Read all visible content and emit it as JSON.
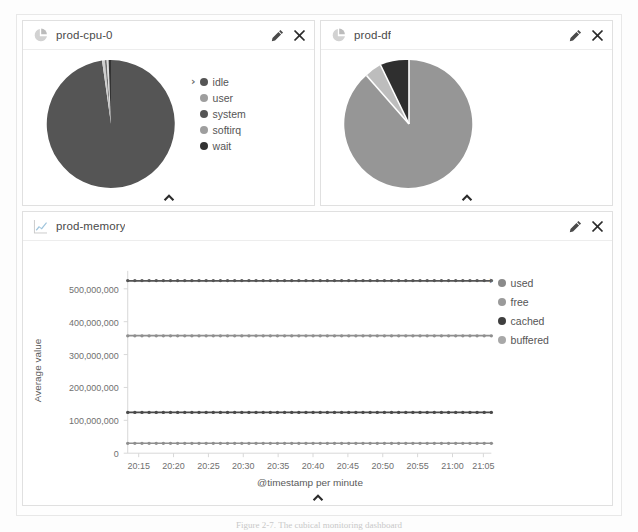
{
  "dashboard": {
    "panels": [
      {
        "id": "prod-cpu-0",
        "title": "prod-cpu-0",
        "icon": "pie-chart-icon",
        "type": "pie",
        "edit_label": "Edit",
        "close_label": "Close",
        "collapse_label": "Collapse panel",
        "legend_toggle": "›",
        "legend": [
          {
            "label": "idle",
            "color": "#555555"
          },
          {
            "label": "user",
            "color": "#9e9e9e"
          },
          {
            "label": "system",
            "color": "#555555"
          },
          {
            "label": "softirq",
            "color": "#9e9e9e"
          },
          {
            "label": "wait",
            "color": "#333333"
          }
        ]
      },
      {
        "id": "prod-df",
        "title": "prod-df",
        "icon": "pie-chart-icon",
        "type": "pie",
        "edit_label": "Edit",
        "close_label": "Close",
        "collapse_label": "Collapse panel",
        "legend_toggle": "›",
        "legend": [
          {
            "label": "free",
            "color": "#969696"
          },
          {
            "label": "used",
            "color": "#bdbdbd"
          },
          {
            "label": "reserved",
            "color": "#3b3b3b"
          }
        ]
      },
      {
        "id": "prod-memory",
        "title": "prod-memory",
        "icon": "line-chart-icon",
        "type": "line",
        "edit_label": "Edit",
        "close_label": "Close",
        "collapse_label": "Collapse panel",
        "legend_toggle": "›",
        "legend": [
          {
            "label": "used",
            "color": "#8a8a8a"
          },
          {
            "label": "free",
            "color": "#9a9a9a"
          },
          {
            "label": "cached",
            "color": "#3f3f3f"
          },
          {
            "label": "buffered",
            "color": "#a8a8a8"
          }
        ]
      }
    ]
  },
  "chart_data": [
    {
      "type": "pie",
      "title": "prod-cpu-0",
      "labels": [
        "idle",
        "user",
        "system",
        "softirq",
        "wait"
      ],
      "values": [
        97.2,
        1.1,
        0.9,
        0.5,
        0.3
      ],
      "colors": [
        "#555555",
        "#c9c9c9",
        "#6f6f6f",
        "#d8d8d8",
        "#333333"
      ],
      "legend": "right"
    },
    {
      "type": "pie",
      "title": "prod-df",
      "labels": [
        "free",
        "used",
        "reserved"
      ],
      "values": [
        82.0,
        10.5,
        7.5
      ],
      "colors": [
        "#969696",
        "#bdbdbd",
        "#2f2f2f"
      ],
      "legend": "right"
    },
    {
      "type": "line",
      "title": "prod-memory",
      "xlabel": "@timestamp per minute",
      "ylabel": "Average value",
      "ylim": [
        0,
        530000000
      ],
      "yticks": [
        0,
        100000000,
        200000000,
        300000000,
        400000000,
        500000000
      ],
      "ytick_labels": [
        "0",
        "100,000,000",
        "200,000,000",
        "300,000,000",
        "400,000,000",
        "500,000,000"
      ],
      "xticks": [
        "20:15",
        "20:20",
        "20:25",
        "20:30",
        "20:35",
        "20:40",
        "20:45",
        "20:50",
        "20:55",
        "21:00",
        "21:05"
      ],
      "grid": false,
      "legend": "right",
      "markers": true,
      "series": [
        {
          "name": "used",
          "value": 525000000,
          "color": "#555555"
        },
        {
          "name": "free",
          "value": 357000000,
          "color": "#8f8f8f"
        },
        {
          "name": "cached",
          "value": 124000000,
          "color": "#4a4a4a"
        },
        {
          "name": "buffered",
          "value": 30000000,
          "color": "#8f8f8f"
        }
      ]
    }
  ],
  "caption": {
    "text": "Figure 2-7. The cubical monitoring dashboard"
  }
}
